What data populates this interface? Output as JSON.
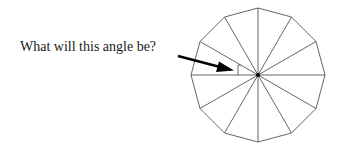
{
  "question": {
    "label": "What will this angle be?"
  },
  "figure": {
    "shape": "regular dodecagon",
    "sides": 12,
    "center": [
      258,
      75
    ],
    "radius": 67,
    "spokes": 12,
    "marked_angle": "angle between two adjacent spokes at center",
    "colors": {
      "stroke": "#555555",
      "arrow": "#000000",
      "background": "#ffffff"
    }
  }
}
